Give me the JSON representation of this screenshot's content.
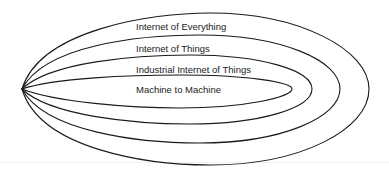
{
  "diagram": {
    "type": "nested-ellipses",
    "stroke_color": "#1a1a1a",
    "background": "#ffffff",
    "layers": [
      {
        "label": "Internet of Everything",
        "level": 1,
        "right_x": 369,
        "top_y": 13,
        "bottom_y": 165
      },
      {
        "label": "Internet of Things",
        "level": 2,
        "right_x": 340,
        "top_y": 35,
        "bottom_y": 143
      },
      {
        "label": "Industrial Internet of Things",
        "level": 3,
        "right_x": 312,
        "top_y": 55,
        "bottom_y": 124
      },
      {
        "label": "Machine to Machine",
        "level": 4,
        "right_x": 292,
        "top_y": 75,
        "bottom_y": 108
      }
    ]
  }
}
